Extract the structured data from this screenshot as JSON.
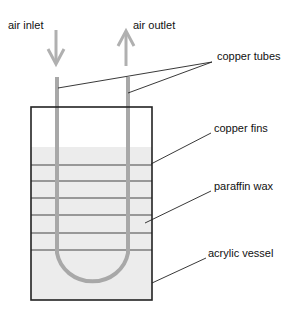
{
  "labels": {
    "air_inlet": "air inlet",
    "air_outlet": "air outlet",
    "copper_tubes": "copper tubes",
    "copper_fins": "copper fins",
    "paraffin_wax": "paraffin wax",
    "acrylic_vessel": "acrylic vessel"
  },
  "colors": {
    "tube": "#a8a8a8",
    "wax": "#ececec",
    "outline": "#222222",
    "arrow": "#b0b0b0"
  }
}
